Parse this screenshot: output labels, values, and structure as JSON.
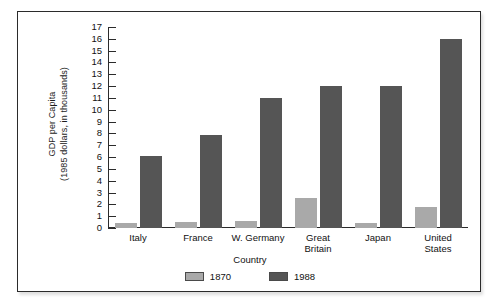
{
  "chart_data": {
    "type": "bar",
    "title": "",
    "xlabel": "Country",
    "ylabel": "GDP per Capita\n(1985 dollars, in thousands)",
    "ylabel_line1": "GDP per Capita",
    "ylabel_line2": "(1985 dollars, in thousands)",
    "categories": [
      "Italy",
      "France",
      "W. Germany",
      "Great Britain",
      "Japan",
      "United States"
    ],
    "category_lines": [
      [
        "Italy"
      ],
      [
        "France"
      ],
      [
        "W. Germany"
      ],
      [
        "Great",
        "Britain"
      ],
      [
        "Japan"
      ],
      [
        "United",
        "States"
      ]
    ],
    "series": [
      {
        "name": "1870",
        "color": "#a9a9a9",
        "values": [
          0.4,
          0.5,
          0.6,
          2.5,
          0.4,
          1.8
        ]
      },
      {
        "name": "1988",
        "color": "#555555",
        "values": [
          6.1,
          7.9,
          11.0,
          12.0,
          12.0,
          16.0
        ]
      }
    ],
    "ylim": [
      0,
      17
    ],
    "ytick_labels": [
      "0",
      "1",
      "2",
      "3",
      "4",
      "5",
      "6",
      "7",
      "8",
      "9",
      "10",
      "11",
      "12",
      "13",
      "14",
      "15",
      "16",
      "17"
    ],
    "ytick_values": [
      0,
      1,
      2,
      3,
      4,
      5,
      6,
      7,
      8,
      9,
      10,
      11,
      12,
      13,
      14,
      15,
      16,
      17
    ],
    "grid": false,
    "legend_position": "bottom-center"
  },
  "colors": {
    "series_1870": "#a9a9a9",
    "series_1988": "#555555",
    "axis": "#2b2b2b",
    "frame_border": "#2b2b2b",
    "background": "#ffffff",
    "text": "#111111"
  }
}
